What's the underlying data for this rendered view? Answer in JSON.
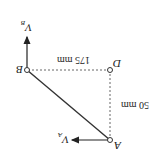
{
  "diagram": {
    "orientation": "rotated 180 degrees",
    "points": {
      "A": {
        "label": "A"
      },
      "B": {
        "label": "B"
      },
      "D": {
        "label": "D"
      }
    },
    "velocities": {
      "VA": {
        "symbol": "V",
        "subscript": "A"
      },
      "VB": {
        "symbol": "V",
        "subscript": "B"
      }
    },
    "dimensions": {
      "horizontal": "175 mm",
      "vertical": "50 mm"
    },
    "colors": {
      "line": "#333333",
      "dashed": "#666666"
    }
  }
}
